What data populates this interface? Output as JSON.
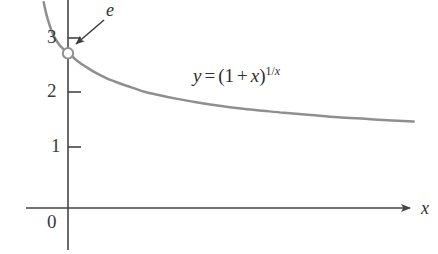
{
  "figure": {
    "name": "graph-of-1-plus-x-to-the-1-over-x",
    "background_color": "#ffffff"
  },
  "chart_data": {
    "type": "line",
    "title": "",
    "subtitle": "",
    "xlabel": "x",
    "ylabel": "",
    "xlim": [
      -0.05,
      6.5
    ],
    "ylim": [
      0,
      3.6
    ],
    "grid": false,
    "legend": null,
    "curve_color": "#8f8f8f",
    "axis_color": "#454545",
    "annotations": [
      {
        "name": "limit-label-e",
        "text": "e",
        "style": "italic",
        "points_to": "open-circle-at-x-equals-zero",
        "arrow": true
      },
      {
        "name": "equation-label",
        "text": "y = (1 + x)^(1/x)",
        "parts": {
          "lhs": "y",
          "equals": "=",
          "open_paren": "(",
          "one": "1",
          "plus": "+",
          "x": "x",
          "close_paren": ")",
          "exponent_numerator": "1",
          "exponent_slash": "/",
          "exponent_denominator": "x"
        }
      },
      {
        "name": "open-circle-marker",
        "text": "",
        "at_x": 0,
        "at_y": 2.71828,
        "filled": false
      }
    ],
    "x_ticks": [],
    "x_tick_labels": [],
    "y_ticks": [
      0,
      1,
      2,
      3
    ],
    "y_tick_labels": [
      "0",
      "1",
      "2",
      "3"
    ],
    "series": [
      {
        "name": "y = (1 + x)^(1/x)",
        "x": [
          -0.45,
          -0.4,
          -0.35,
          -0.3,
          -0.25,
          -0.2,
          -0.15,
          -0.1,
          -0.05,
          0.0,
          0.05,
          0.1,
          0.2,
          0.3,
          0.4,
          0.5,
          0.7,
          0.9,
          1.1,
          1.4,
          1.7,
          2.0,
          2.4,
          2.8,
          3.2,
          3.6,
          4.0,
          4.5,
          5.0,
          5.5,
          6.0,
          6.4
        ],
        "y": [
          3.65,
          3.43,
          3.26,
          3.12,
          3.01,
          2.93,
          2.86,
          2.81,
          2.76,
          2.71828,
          2.68,
          2.64,
          2.56,
          2.49,
          2.43,
          2.37,
          2.27,
          2.19,
          2.12,
          2.02,
          1.95,
          1.89,
          1.82,
          1.76,
          1.71,
          1.67,
          1.63,
          1.59,
          1.55,
          1.52,
          1.49,
          1.47
        ]
      }
    ]
  },
  "axes": {
    "y_axis": {
      "name": "y-axis",
      "label": ""
    },
    "x_axis": {
      "name": "x-axis",
      "label": "x"
    }
  },
  "labels": {
    "y_tick_3": "3",
    "y_tick_2": "2",
    "y_tick_1": "1",
    "origin": "0",
    "e_label": "e",
    "x_axis_label": "x",
    "equation": {
      "y": "y",
      "equals": "=",
      "open_paren": "(",
      "one": "1",
      "plus": "+",
      "x_base": "x",
      "close_paren": ")",
      "exp_one": "1",
      "exp_slash": "/",
      "exp_x": "x"
    }
  }
}
